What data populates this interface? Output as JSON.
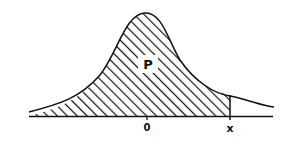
{
  "diagram": {
    "type": "normal-distribution-cdf",
    "region_label": "P",
    "axis_labels": {
      "mean": "0",
      "value": "x"
    },
    "shaded": "area under curve left of x",
    "colors": {
      "ink": "#111111",
      "background": "#ffffff"
    }
  }
}
